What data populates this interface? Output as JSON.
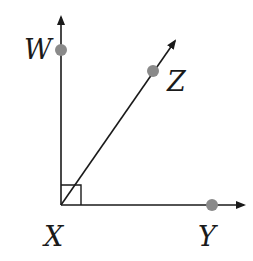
{
  "diagram": {
    "type": "geometry-rays",
    "vertex": {
      "label": "X",
      "x": 61,
      "y": 205
    },
    "rays": [
      {
        "name": "XW",
        "end_point": "W",
        "point": {
          "x": 61,
          "y": 50
        },
        "arrow_tip": {
          "x": 61,
          "y": 15
        }
      },
      {
        "name": "XZ",
        "end_point": "Z",
        "point": {
          "x": 153,
          "y": 71
        },
        "arrow_tip": {
          "x": 177,
          "y": 38
        }
      },
      {
        "name": "XY",
        "end_point": "Y",
        "point": {
          "x": 212,
          "y": 205
        },
        "arrow_tip": {
          "x": 246,
          "y": 205
        }
      }
    ],
    "labels": {
      "W": "W",
      "Z": "Z",
      "X": "X",
      "Y": "Y"
    },
    "right_angle_marker": {
      "at": "X",
      "between": [
        "XW",
        "XY"
      ],
      "size": 20
    },
    "colors": {
      "line": "#1a1a1a",
      "point": "#8a8a8a",
      "background": "#ffffff"
    }
  }
}
